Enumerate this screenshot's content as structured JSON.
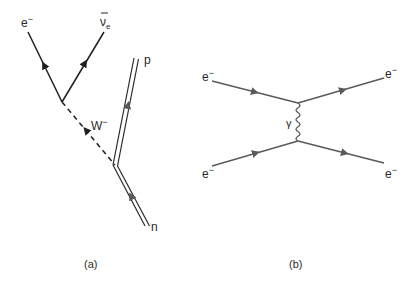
{
  "diagram_a": {
    "caption": "(a)",
    "labels": {
      "electron": "e",
      "electron_sup": "−",
      "antineutrino": "ν",
      "antineutrino_sub": "e",
      "w_boson": "W",
      "w_boson_sup": "−",
      "proton": "p",
      "neutron": "n"
    }
  },
  "diagram_b": {
    "caption": "(b)",
    "labels": {
      "electron_in_top": "e",
      "electron_in_bottom": "e",
      "electron_out_top": "e",
      "electron_out_bottom": "e",
      "charge": "−",
      "photon": "γ"
    }
  },
  "colors": {
    "line_a": "#1f1f1f",
    "line_b": "#5a5a5a",
    "text": "#2a2a2a"
  }
}
